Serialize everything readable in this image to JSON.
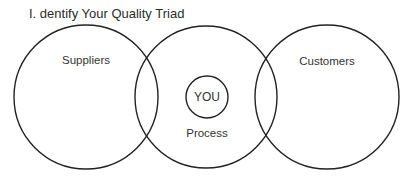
{
  "title": "I. dentify Your Quality Triad",
  "diagram": {
    "type": "venn",
    "circles": [
      {
        "label": "Suppliers",
        "cx": 86,
        "cy": 97,
        "r": 72
      },
      {
        "label": "Process",
        "cx": 206,
        "cy": 97,
        "r": 71
      },
      {
        "label": "Customers",
        "cx": 327,
        "cy": 97,
        "r": 72
      }
    ],
    "center": {
      "label": "YOU",
      "cx": 207,
      "cy": 97,
      "r": 21
    },
    "stroke_color": "#222222"
  }
}
